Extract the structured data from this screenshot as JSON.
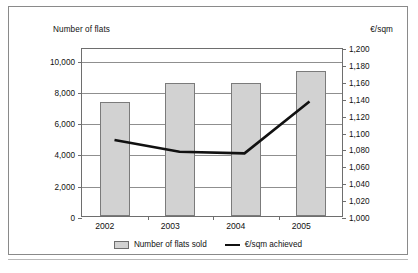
{
  "chart_data": {
    "type": "bar",
    "title": "",
    "subtitle": "",
    "categories": [
      "2002",
      "2003",
      "2004",
      "2005"
    ],
    "xlabel": "",
    "grid": true,
    "legend_position": "bottom-center",
    "axes": {
      "left": {
        "label": "Number of flats",
        "ticks": [
          "0",
          "2,000",
          "4,000",
          "6,000",
          "8,000",
          "10,000"
        ],
        "tick_values": [
          0,
          2000,
          4000,
          6000,
          8000,
          10000
        ],
        "ylim": [
          0,
          10800
        ],
        "step": 2000
      },
      "right": {
        "label": "€/sqm",
        "ticks": [
          "1,000",
          "1,020",
          "1,040",
          "1,060",
          "1,080",
          "1,100",
          "1,120",
          "1,140",
          "1,160",
          "1,180",
          "1,200"
        ],
        "tick_values": [
          1000,
          1020,
          1040,
          1060,
          1080,
          1100,
          1120,
          1140,
          1160,
          1180,
          1200
        ],
        "ylim": [
          1000,
          1200
        ],
        "step": 20
      }
    },
    "series": [
      {
        "name": "Number of flats sold",
        "type": "bar",
        "axis": "left",
        "color": "#d2d2d2",
        "edge_color": "#7b7b7b",
        "values": [
          7300,
          8500,
          8500,
          9250
        ]
      },
      {
        "name": "€/sqm achieved",
        "type": "line",
        "axis": "right",
        "color": "#111111",
        "values": [
          1091,
          1077,
          1075,
          1137
        ]
      }
    ]
  },
  "legend": {
    "items": [
      {
        "label": "Number of flats sold",
        "marker": "box-swatch"
      },
      {
        "label": "€/sqm achieved",
        "marker": "line-swatch"
      }
    ]
  }
}
